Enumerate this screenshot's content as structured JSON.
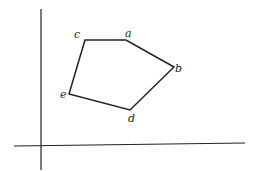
{
  "diagram": {
    "type": "polygon-on-axes",
    "axes": {
      "y_axis": {
        "x": 41,
        "y1": 9,
        "y2": 170
      },
      "x_axis": {
        "x1": 14,
        "x2": 245,
        "y_left": 146,
        "y_right": 143
      }
    },
    "vertices": [
      {
        "label": "a",
        "x": 126,
        "y": 40
      },
      {
        "label": "b",
        "x": 174,
        "y": 67
      },
      {
        "label": "c",
        "x": 85,
        "y": 40
      },
      {
        "label": "d",
        "x": 130,
        "y": 110
      },
      {
        "label": "e",
        "x": 69,
        "y": 94
      }
    ],
    "polygon_order": [
      "c",
      "a",
      "b",
      "d",
      "e"
    ],
    "stroke_color": "#222222"
  }
}
